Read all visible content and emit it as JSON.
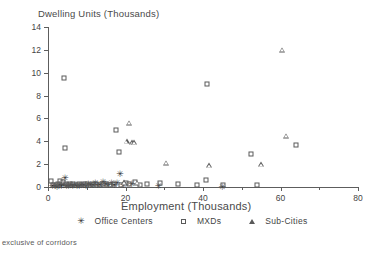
{
  "chart_data": {
    "type": "scatter",
    "title": "",
    "xlabel": "Employment (Thousands)",
    "ylabel": "Dwelling Units (Thousands)",
    "xlim": [
      0,
      80
    ],
    "ylim": [
      0,
      14
    ],
    "xticks": [
      0,
      20,
      40,
      60,
      80
    ],
    "yticks": [
      0,
      2,
      4,
      6,
      8,
      10,
      12,
      14
    ],
    "xtick_labels": [
      "0",
      "20",
      "40",
      "60",
      "80"
    ],
    "ytick_labels": [
      "0",
      "2",
      "4",
      "6",
      "8",
      "10",
      "12",
      "14"
    ],
    "x_minor_ticks": [
      10,
      30,
      50,
      70
    ],
    "grid": false,
    "legend_position": "below",
    "footnote": "exclusive of corridors",
    "series": [
      {
        "name": "Office Centers",
        "marker": "star",
        "points": [
          [
            1.2,
            0.15
          ],
          [
            1.8,
            0.2
          ],
          [
            2.3,
            0.1
          ],
          [
            2.9,
            0.25
          ],
          [
            3.4,
            0.15
          ],
          [
            4.0,
            0.3
          ],
          [
            4.4,
            0.9
          ],
          [
            4.8,
            0.2
          ],
          [
            5.3,
            0.15
          ],
          [
            5.9,
            0.25
          ],
          [
            6.4,
            0.2
          ],
          [
            6.9,
            0.3
          ],
          [
            7.5,
            0.2
          ],
          [
            8.1,
            0.15
          ],
          [
            8.6,
            0.25
          ],
          [
            9.2,
            0.3
          ],
          [
            9.8,
            0.2
          ],
          [
            10.4,
            0.35
          ],
          [
            11.0,
            0.25
          ],
          [
            11.6,
            0.3
          ],
          [
            12.2,
            0.4
          ],
          [
            12.8,
            0.25
          ],
          [
            13.4,
            0.3
          ],
          [
            14.2,
            0.5
          ],
          [
            14.9,
            0.35
          ],
          [
            15.6,
            0.25
          ],
          [
            16.4,
            0.4
          ],
          [
            17.1,
            0.3
          ],
          [
            17.8,
            0.45
          ],
          [
            18.6,
            1.25
          ],
          [
            19.4,
            0.3
          ],
          [
            21.6,
            0.35
          ],
          [
            28.5,
            0.15
          ],
          [
            45.0,
            0.1
          ]
        ]
      },
      {
        "name": "MXDs",
        "marker": "square",
        "points": [
          [
            0.8,
            0.55
          ],
          [
            1.4,
            0.2
          ],
          [
            2.0,
            0.15
          ],
          [
            2.6,
            0.3
          ],
          [
            3.2,
            0.5
          ],
          [
            3.8,
            0.45
          ],
          [
            4.1,
            9.5
          ],
          [
            4.3,
            3.4
          ],
          [
            4.6,
            0.25
          ],
          [
            5.2,
            0.2
          ],
          [
            5.8,
            0.3
          ],
          [
            6.5,
            0.25
          ],
          [
            7.2,
            0.2
          ],
          [
            7.9,
            0.3
          ],
          [
            8.6,
            0.2
          ],
          [
            9.3,
            0.25
          ],
          [
            10.1,
            0.3
          ],
          [
            10.9,
            0.2
          ],
          [
            11.7,
            0.25
          ],
          [
            12.5,
            0.3
          ],
          [
            13.3,
            0.2
          ],
          [
            14.1,
            0.25
          ],
          [
            15.0,
            0.3
          ],
          [
            16.0,
            0.2
          ],
          [
            17.0,
            0.3
          ],
          [
            17.6,
            5.0
          ],
          [
            18.2,
            3.1
          ],
          [
            18.9,
            0.2
          ],
          [
            20.0,
            0.35
          ],
          [
            21.0,
            0.25
          ],
          [
            22.4,
            0.45
          ],
          [
            23.8,
            0.2
          ],
          [
            25.6,
            0.3
          ],
          [
            29.0,
            0.35
          ],
          [
            33.5,
            0.25
          ],
          [
            38.5,
            0.2
          ],
          [
            41.0,
            9.0
          ],
          [
            40.8,
            0.6
          ],
          [
            45.2,
            0.15
          ],
          [
            52.5,
            2.9
          ],
          [
            54.0,
            0.2
          ],
          [
            64.0,
            3.7
          ]
        ]
      },
      {
        "name": "Sub-Cities",
        "marker": "triangle",
        "points": [
          [
            19.6,
            0.4
          ],
          [
            20.3,
            4.0
          ],
          [
            20.9,
            5.6
          ],
          [
            21.7,
            3.9
          ],
          [
            22.3,
            3.9
          ],
          [
            23.0,
            0.35
          ],
          [
            30.5,
            2.1
          ],
          [
            55.0,
            2.0
          ],
          [
            60.5,
            12.0
          ],
          [
            61.5,
            4.5
          ],
          [
            41.5,
            1.9
          ]
        ]
      }
    ]
  },
  "legend": {
    "entries": [
      {
        "label": "Office Centers",
        "marker": "star"
      },
      {
        "label": "MXDs",
        "marker": "square"
      },
      {
        "label": "Sub-Cities",
        "marker": "triangle"
      }
    ]
  },
  "footnote": {
    "text": "exclusive of corridors"
  }
}
